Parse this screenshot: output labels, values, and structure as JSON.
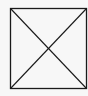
{
  "figure": {
    "type": "crossed-box",
    "box": {
      "x": 10.5,
      "y": 8.5,
      "width": 76,
      "height": 80
    },
    "stroke_color": "#1a1a1a",
    "background_color": "#f7f7f7",
    "stroke_width": 1.3
  }
}
